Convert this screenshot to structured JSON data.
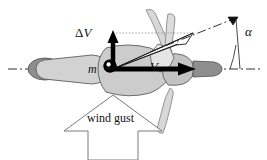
{
  "figure": {
    "background_color": "#ffffff",
    "width": 267,
    "height": 160
  },
  "labels": {
    "delta_v": "ΔV",
    "delta_symbol": "Δ",
    "v_symbol": "V",
    "velocity": "V",
    "mass": "m",
    "alpha": "α",
    "wind_gust": "wind gust"
  },
  "colors": {
    "outline": "#4a4a4a",
    "stroke_dark": "#111111",
    "fuselage_light": "#d2d2d2",
    "fuselage_mid": "#bdbdbd",
    "fuselage_dark": "#8e8e8e",
    "rotor_fill": "#dcdcdc",
    "rotor_stroke": "#8a8a8a",
    "arrow_black": "#000000",
    "axis": "#333333",
    "wind_arrow_stroke": "#7a7a7a",
    "dotted": "#9a9a9a"
  },
  "vectors": [
    {
      "name": "forward-velocity",
      "label": "V",
      "direction": "horizontal-right",
      "origin": [
        113,
        69
      ],
      "tip": [
        193,
        69
      ],
      "style": "solid-black-filled-arrow"
    },
    {
      "name": "gust-velocity-increment",
      "label": "ΔV",
      "direction": "vertical-up",
      "origin": [
        113,
        69
      ],
      "tip": [
        113,
        32
      ],
      "style": "solid-black-filled-arrow"
    },
    {
      "name": "resultant-velocity",
      "label": "",
      "direction": "up-right",
      "origin": [
        113,
        69
      ],
      "tip": [
        192,
        34
      ],
      "style": "thin-outline-arrow"
    },
    {
      "name": "wind-gust",
      "label": "wind gust",
      "direction": "vertical-up",
      "style": "block-arrow-outline"
    }
  ],
  "annotations": {
    "angle": {
      "name": "alpha",
      "symbol": "α",
      "between": [
        "resultant-velocity-axis",
        "horizontal-centerline"
      ]
    },
    "centerline_style": "dash-dot",
    "helper_line_style": "dotted"
  }
}
